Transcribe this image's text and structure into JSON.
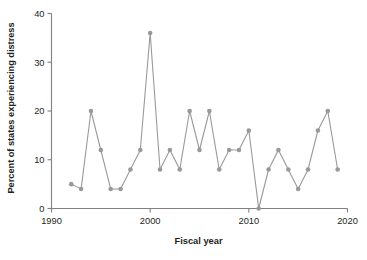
{
  "chart_data": {
    "type": "line",
    "title": "",
    "xlabel": "Fiscal year",
    "ylabel": "Percent of states experiencing distress",
    "xlim": [
      1990,
      2020
    ],
    "ylim": [
      0,
      40
    ],
    "xticks": [
      1990,
      2000,
      2010,
      2020
    ],
    "yticks": [
      0,
      10,
      20,
      30,
      40
    ],
    "xtick_labels": [
      "1990",
      "2000",
      "2010",
      "2020"
    ],
    "ytick_labels": [
      "0",
      "10",
      "20",
      "30",
      "40"
    ],
    "grid": false,
    "legend": false,
    "marker": "circle",
    "series_color": "#999999",
    "x": [
      1992,
      1993,
      1994,
      1995,
      1996,
      1997,
      1998,
      1999,
      2000,
      2001,
      2002,
      2003,
      2004,
      2005,
      2006,
      2007,
      2008,
      2009,
      2010,
      2011,
      2012,
      2013,
      2014,
      2015,
      2016,
      2017,
      2018,
      2019
    ],
    "values": [
      5,
      4,
      20,
      12,
      4,
      4,
      8,
      12,
      36,
      8,
      12,
      8,
      20,
      12,
      20,
      8,
      12,
      12,
      16,
      0,
      8,
      12,
      8,
      4,
      8,
      16,
      20,
      8
    ],
    "series": [
      {
        "name": "Percent of states experiencing distress",
        "values": [
          5,
          4,
          20,
          12,
          4,
          4,
          8,
          12,
          36,
          8,
          12,
          8,
          20,
          12,
          20,
          8,
          12,
          12,
          16,
          0,
          8,
          12,
          8,
          4,
          8,
          16,
          20,
          8
        ]
      }
    ]
  },
  "axis_titles": {
    "x": "Fiscal year",
    "y": "Percent of states experiencing distress"
  }
}
